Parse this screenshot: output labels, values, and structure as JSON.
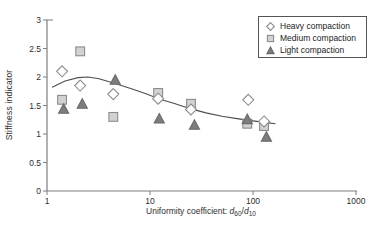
{
  "ui": {
    "background": "#ffffff"
  },
  "chart_data": {
    "type": "scatter",
    "x_scale": "log",
    "title": "",
    "ylabel": "Stiffness indicator",
    "xlabel_plain": "Uniformity coefficient: d60/d10",
    "xlabel_segments": [
      {
        "text": "Uniformity coefficient: "
      },
      {
        "text": "d",
        "style": "italic"
      },
      {
        "text": "60",
        "style": "sub"
      },
      {
        "text": "/"
      },
      {
        "text": "d",
        "style": "italic"
      },
      {
        "text": "10",
        "style": "sub"
      }
    ],
    "xlim": [
      1,
      1000
    ],
    "ylim": [
      0,
      3
    ],
    "x_ticks": [
      1,
      10,
      100,
      1000
    ],
    "y_ticks": [
      0,
      0.5,
      1,
      1.5,
      2,
      2.5,
      3
    ],
    "grid": false,
    "legend_position": "top-right",
    "colors": {
      "axis": "#7f7f7f",
      "curve": "#4d4d4d",
      "text": "#2e2e2e",
      "legend_border": "#555555"
    },
    "series": [
      {
        "name": "Heavy compaction",
        "marker": "diamond",
        "fill": "#ffffff",
        "stroke": "#8c8c8c",
        "points": [
          [
            1.4,
            2.1
          ],
          [
            2.1,
            1.85
          ],
          [
            4.4,
            1.7
          ],
          [
            12,
            1.62
          ],
          [
            25,
            1.43
          ],
          [
            90,
            1.6
          ],
          [
            128,
            1.22
          ]
        ]
      },
      {
        "name": "Medium compaction",
        "marker": "square",
        "fill": "#d2d2d2",
        "stroke": "#8c8c8c",
        "points": [
          [
            1.4,
            1.6
          ],
          [
            2.1,
            2.45
          ],
          [
            4.4,
            1.3
          ],
          [
            12,
            1.72
          ],
          [
            25,
            1.53
          ],
          [
            88,
            1.18
          ],
          [
            128,
            1.14
          ]
        ]
      },
      {
        "name": "Light compaction",
        "marker": "triangle",
        "fill": "#7d7d7d",
        "stroke": "#6a6a6a",
        "points": [
          [
            1.45,
            1.44
          ],
          [
            2.2,
            1.53
          ],
          [
            4.6,
            1.95
          ],
          [
            12.3,
            1.27
          ],
          [
            27,
            1.16
          ],
          [
            88,
            1.26
          ],
          [
            135,
            0.95
          ]
        ]
      }
    ],
    "trend_curve": [
      [
        1.12,
        1.82
      ],
      [
        1.5,
        1.93
      ],
      [
        2.0,
        1.99
      ],
      [
        2.5,
        2.0
      ],
      [
        3.2,
        1.97
      ],
      [
        4.5,
        1.89
      ],
      [
        6.5,
        1.8
      ],
      [
        9,
        1.71
      ],
      [
        12.5,
        1.61
      ],
      [
        17,
        1.54
      ],
      [
        25,
        1.44
      ],
      [
        35,
        1.37
      ],
      [
        50,
        1.31
      ],
      [
        70,
        1.27
      ],
      [
        100,
        1.23
      ],
      [
        135,
        1.2
      ],
      [
        165,
        1.18
      ]
    ]
  }
}
